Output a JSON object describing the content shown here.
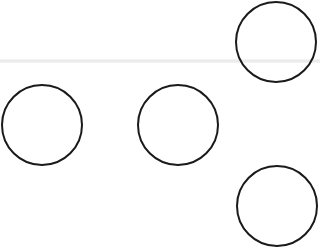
{
  "diagram": {
    "background": "#ffffff",
    "stroke_color": "#1a1a1a",
    "stroke_width": 2,
    "faint_line": {
      "y": 61,
      "color": "#e8e8e8"
    },
    "circles": [
      {
        "id": "top-right",
        "cx": 276,
        "cy": 42,
        "r": 40
      },
      {
        "id": "middle-left",
        "cx": 42,
        "cy": 125,
        "r": 40
      },
      {
        "id": "middle-center",
        "cx": 178,
        "cy": 125,
        "r": 40
      },
      {
        "id": "bottom-right",
        "cx": 277,
        "cy": 206,
        "r": 40
      }
    ]
  }
}
